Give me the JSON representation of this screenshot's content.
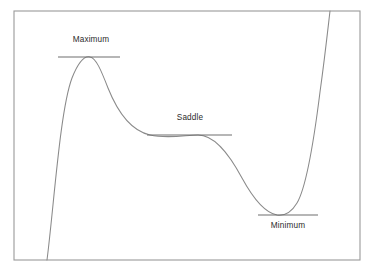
{
  "figure": {
    "background_color": "#ffffff",
    "frame": {
      "name": "plot-border",
      "x": 14,
      "y": 11,
      "width": 346,
      "height": 249,
      "stroke_color": "#9a9a9a"
    },
    "curve": {
      "name": "cubic-curve",
      "stroke_color": "#8a8a8a",
      "path": "M 47,260 C 54,205 60,110 72,78 C 80,58 86,56 90,57 C 96,58 101,70 108,88 C 118,113 132,131 150,135 C 168,139 186,135 198,135 C 214,135 228,152 242,178 C 254,200 266,213 277,215 C 284,216 291,213 297,203 C 306,188 314,140 320,92 C 325,56 328,28 330,11"
    },
    "tangents": [
      {
        "name": "maximum-tangent-line",
        "x1": 58,
        "y1": 57,
        "x2": 120,
        "y2": 57
      },
      {
        "name": "saddle-tangent-line",
        "x1": 147,
        "y1": 135,
        "x2": 232,
        "y2": 135
      },
      {
        "name": "minimum-tangent-line",
        "x1": 258,
        "y1": 215,
        "x2": 318,
        "y2": 215
      }
    ],
    "labels": [
      {
        "name": "maximum-label",
        "text": "Maximum",
        "x": 91,
        "y": 36,
        "position": "above"
      },
      {
        "name": "saddle-label",
        "text": "Saddle",
        "x": 190,
        "y": 114,
        "position": "above"
      },
      {
        "name": "minimum-label",
        "text": "Minimum",
        "x": 288,
        "y": 222,
        "position": "below"
      }
    ]
  },
  "chart_data": {
    "type": "line",
    "title": "",
    "xlabel": "",
    "ylabel": "",
    "grid": false,
    "legend": "none",
    "axis_visible": false,
    "series": [
      {
        "name": "curve",
        "points": [
          [
            47,
            260
          ],
          [
            52,
            220
          ],
          [
            58,
            160
          ],
          [
            64,
            115
          ],
          [
            70,
            82
          ],
          [
            78,
            63
          ],
          [
            84,
            57
          ],
          [
            90,
            57
          ],
          [
            96,
            59
          ],
          [
            102,
            70
          ],
          [
            110,
            91
          ],
          [
            120,
            112
          ],
          [
            132,
            126
          ],
          [
            145,
            134
          ],
          [
            160,
            136
          ],
          [
            175,
            136
          ],
          [
            190,
            135
          ],
          [
            205,
            138
          ],
          [
            218,
            153
          ],
          [
            232,
            172
          ],
          [
            245,
            191
          ],
          [
            258,
            205
          ],
          [
            270,
            213
          ],
          [
            280,
            216
          ],
          [
            290,
            214
          ],
          [
            299,
            203
          ],
          [
            307,
            180
          ],
          [
            313,
            145
          ],
          [
            319,
            104
          ],
          [
            325,
            58
          ],
          [
            330,
            11
          ]
        ]
      }
    ],
    "annotations": [
      {
        "label": "Maximum",
        "type": "local-maximum",
        "x": 90,
        "y": 57,
        "tangent_x_range": [
          58,
          120
        ]
      },
      {
        "label": "Saddle",
        "type": "saddle-point",
        "x": 190,
        "y": 135,
        "tangent_x_range": [
          147,
          232
        ]
      },
      {
        "label": "Minimum",
        "type": "local-minimum",
        "x": 288,
        "y": 215,
        "tangent_x_range": [
          258,
          318
        ]
      }
    ],
    "xlim": [
      14,
      360
    ],
    "ylim": [
      11,
      260
    ],
    "y_axis_inverted": true
  }
}
